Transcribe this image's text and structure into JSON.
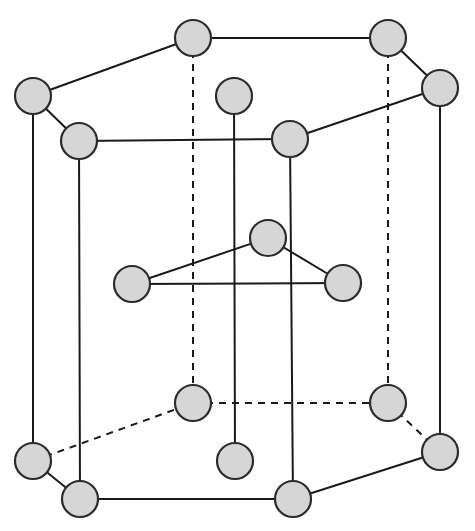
{
  "figure": {
    "name": "hcp-unit-cell",
    "canvas": {
      "width": 475,
      "height": 531,
      "background": "#ffffff"
    },
    "style": {
      "atom_fill": "#d6d6d6",
      "atom_stroke": "#2b2b2b",
      "atom_radius": 18,
      "bond_color": "#1a1a1a",
      "bond_width": 2,
      "dash_pattern": "7 6"
    },
    "atoms": [
      {
        "id": "top-back",
        "label": "top hexagon back corner",
        "x": 193,
        "y": 38,
        "r": 18,
        "layer": "top"
      },
      {
        "id": "top-right-back",
        "label": "top hexagon right-back corner",
        "x": 388,
        "y": 38,
        "r": 18,
        "layer": "top"
      },
      {
        "id": "top-left",
        "label": "top hexagon left corner",
        "x": 33,
        "y": 96,
        "r": 18,
        "layer": "top"
      },
      {
        "id": "top-right",
        "label": "top hexagon right corner",
        "x": 440,
        "y": 88,
        "r": 18,
        "layer": "top"
      },
      {
        "id": "top-center-face",
        "label": "top basal face center atom",
        "x": 234,
        "y": 96,
        "r": 18,
        "layer": "top"
      },
      {
        "id": "top-front-left",
        "label": "top hexagon front-left corner",
        "x": 79,
        "y": 141,
        "r": 18,
        "layer": "top"
      },
      {
        "id": "top-front-right",
        "label": "top hexagon front-right corner",
        "x": 290,
        "y": 139,
        "r": 18,
        "layer": "top"
      },
      {
        "id": "mid-left",
        "label": "midplane interior left atom",
        "x": 132,
        "y": 284,
        "r": 18,
        "layer": "middle"
      },
      {
        "id": "mid-top",
        "label": "midplane interior back atom",
        "x": 268,
        "y": 238,
        "r": 18,
        "layer": "middle"
      },
      {
        "id": "mid-right",
        "label": "midplane interior right atom",
        "x": 343,
        "y": 283,
        "r": 18,
        "layer": "middle"
      },
      {
        "id": "bot-back",
        "label": "bottom hexagon back corner",
        "x": 193,
        "y": 403,
        "r": 18,
        "layer": "bottom"
      },
      {
        "id": "bot-right-back",
        "label": "bottom hexagon right-back corner",
        "x": 388,
        "y": 403,
        "r": 18,
        "layer": "bottom"
      },
      {
        "id": "bot-left",
        "label": "bottom hexagon left corner",
        "x": 33,
        "y": 461,
        "r": 18,
        "layer": "bottom"
      },
      {
        "id": "bot-right",
        "label": "bottom hexagon right corner",
        "x": 440,
        "y": 452,
        "r": 18,
        "layer": "bottom"
      },
      {
        "id": "bot-center-face",
        "label": "bottom basal face center atom",
        "x": 235,
        "y": 461,
        "r": 18,
        "layer": "bottom"
      },
      {
        "id": "bot-front-left",
        "label": "bottom hexagon front-left corner",
        "x": 80,
        "y": 499,
        "r": 18,
        "layer": "bottom"
      },
      {
        "id": "bot-front-right",
        "label": "bottom hexagon front-right corner",
        "x": 293,
        "y": 499,
        "r": 18,
        "layer": "bottom"
      }
    ],
    "bonds": [
      {
        "id": "top-edge-back",
        "from": "top-back",
        "to": "top-right-back",
        "style": "solid"
      },
      {
        "id": "top-edge-back-left",
        "from": "top-left",
        "to": "top-back",
        "style": "solid"
      },
      {
        "id": "top-edge-right-up",
        "from": "top-right-back",
        "to": "top-right",
        "style": "solid"
      },
      {
        "id": "top-edge-left-down",
        "from": "top-left",
        "to": "top-front-left",
        "style": "solid"
      },
      {
        "id": "top-edge-front",
        "from": "top-front-left",
        "to": "top-front-right",
        "style": "solid"
      },
      {
        "id": "top-edge-right-down",
        "from": "top-front-right",
        "to": "top-right",
        "style": "solid"
      },
      {
        "id": "vert-left",
        "from": "top-left",
        "to": "bot-left",
        "style": "solid"
      },
      {
        "id": "vert-front-left",
        "from": "top-front-left",
        "to": "bot-front-left",
        "style": "solid"
      },
      {
        "id": "vert-front-right",
        "from": "top-front-right",
        "to": "bot-front-right",
        "style": "solid"
      },
      {
        "id": "vert-right",
        "from": "top-right",
        "to": "bot-right",
        "style": "solid"
      },
      {
        "id": "vert-back-dashed",
        "from": "top-back",
        "to": "bot-back",
        "style": "dashed"
      },
      {
        "id": "vert-right-back-dashed",
        "from": "top-right-back",
        "to": "bot-right-back",
        "style": "dashed"
      },
      {
        "id": "vert-center-face",
        "from": "top-center-face",
        "to": "bot-center-face",
        "style": "solid"
      },
      {
        "id": "mid-bond-left-top",
        "from": "mid-left",
        "to": "mid-top",
        "style": "solid"
      },
      {
        "id": "mid-bond-top-right",
        "from": "mid-top",
        "to": "mid-right",
        "style": "solid"
      },
      {
        "id": "mid-bond-left-right",
        "from": "mid-left",
        "to": "mid-right",
        "style": "solid"
      },
      {
        "id": "bot-edge-back",
        "from": "bot-back",
        "to": "bot-right-back",
        "style": "dashed"
      },
      {
        "id": "bot-edge-back-left",
        "from": "bot-left",
        "to": "bot-back",
        "style": "dashed"
      },
      {
        "id": "bot-edge-right-up",
        "from": "bot-right-back",
        "to": "bot-right",
        "style": "dashed"
      },
      {
        "id": "bot-edge-left-down",
        "from": "bot-left",
        "to": "bot-front-left",
        "style": "solid"
      },
      {
        "id": "bot-edge-front",
        "from": "bot-front-left",
        "to": "bot-front-right",
        "style": "solid"
      },
      {
        "id": "bot-edge-right-down",
        "from": "bot-front-right",
        "to": "bot-right",
        "style": "solid"
      }
    ]
  }
}
